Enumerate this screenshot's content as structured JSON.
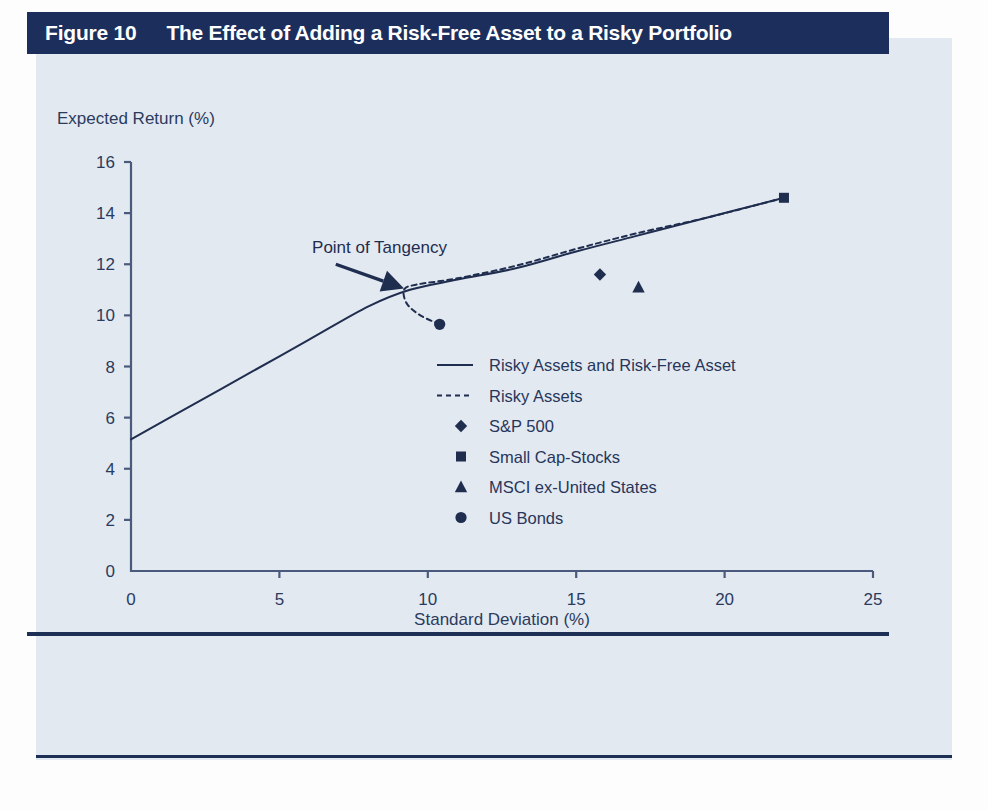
{
  "figure": {
    "number_label": "Figure 10",
    "title": "The Effect of Adding a Risk-Free Asset to a Risky Portfolio",
    "header_bg": "#1c2f5c",
    "header_fg": "#ffffff",
    "panel_bg": "#e3e9f1",
    "ink": "#1f2d4f"
  },
  "chart_data": {
    "type": "line",
    "title": "The Effect of Adding a Risk-Free Asset to a Risky Portfolio",
    "subtitle": "",
    "xlabel": "Standard Deviation (%)",
    "ylabel": "Expected Return (%)",
    "xlim": [
      0,
      25
    ],
    "ylim": [
      0,
      16
    ],
    "xticks": [
      0,
      5,
      10,
      15,
      20,
      25
    ],
    "yticks": [
      0,
      2,
      4,
      6,
      8,
      10,
      12,
      14,
      16
    ],
    "grid": false,
    "legend_position": "center-right-inside",
    "annotations": [
      {
        "text": "Point of Tangency",
        "text_x": 6.1,
        "text_y": 12.45,
        "arrow_from_x": 6.9,
        "arrow_from_y": 12.0,
        "arrow_to_x": 9.2,
        "arrow_to_y": 11.05
      }
    ],
    "series": [
      {
        "name": "Risky Assets and Risk-Free Asset",
        "marker": "none",
        "style": "solid",
        "color": "#1f2d4f",
        "points": [
          {
            "x": 0.0,
            "y": 5.15
          },
          {
            "x": 2.0,
            "y": 6.45
          },
          {
            "x": 4.0,
            "y": 7.75
          },
          {
            "x": 6.0,
            "y": 9.05
          },
          {
            "x": 8.0,
            "y": 10.35
          },
          {
            "x": 9.4,
            "y": 11.0
          },
          {
            "x": 11.0,
            "y": 11.4
          },
          {
            "x": 13.0,
            "y": 11.85
          },
          {
            "x": 15.0,
            "y": 12.5
          },
          {
            "x": 17.0,
            "y": 13.1
          },
          {
            "x": 19.0,
            "y": 13.7
          },
          {
            "x": 22.0,
            "y": 14.6
          }
        ]
      },
      {
        "name": "Risky Assets",
        "marker": "none",
        "style": "dashed",
        "color": "#1f2d4f",
        "points": [
          {
            "x": 10.4,
            "y": 9.65
          },
          {
            "x": 9.75,
            "y": 10.0
          },
          {
            "x": 9.3,
            "y": 10.45
          },
          {
            "x": 9.2,
            "y": 11.0
          },
          {
            "x": 9.6,
            "y": 11.2
          },
          {
            "x": 11.0,
            "y": 11.45
          },
          {
            "x": 13.0,
            "y": 11.95
          },
          {
            "x": 15.0,
            "y": 12.6
          },
          {
            "x": 17.0,
            "y": 13.2
          },
          {
            "x": 19.5,
            "y": 13.85
          },
          {
            "x": 22.0,
            "y": 14.6
          }
        ]
      }
    ],
    "points": [
      {
        "name": "S&P 500",
        "marker": "diamond",
        "x": 15.8,
        "y": 11.6
      },
      {
        "name": "Small Cap-Stocks",
        "marker": "square",
        "x": 22.0,
        "y": 14.6
      },
      {
        "name": "MSCI ex-United States",
        "marker": "triangle",
        "x": 17.1,
        "y": 11.1
      },
      {
        "name": "US Bonds",
        "marker": "circle",
        "x": 10.4,
        "y": 9.65
      }
    ],
    "legend": [
      {
        "label": "Risky Assets and Risk-Free Asset",
        "glyph": "solid-line"
      },
      {
        "label": "Risky Assets",
        "glyph": "dashed-line"
      },
      {
        "label": "S&P 500",
        "glyph": "diamond"
      },
      {
        "label": "Small Cap-Stocks",
        "glyph": "square"
      },
      {
        "label": "MSCI ex-United States",
        "glyph": "triangle"
      },
      {
        "label": "US Bonds",
        "glyph": "circle"
      }
    ]
  }
}
